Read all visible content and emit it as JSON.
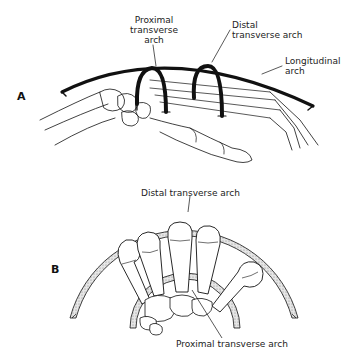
{
  "figure": {
    "panels": [
      {
        "id": "A",
        "letter": "A",
        "labels": {
          "proximal": [
            "Proximal",
            "transverse",
            "arch"
          ],
          "distal": [
            "Distal",
            "transverse arch"
          ],
          "longitudinal": [
            "Longitudinal",
            "arch"
          ]
        }
      },
      {
        "id": "B",
        "letter": "B",
        "labels": {
          "distal": "Distal transverse arch",
          "proximal": "Proximal transverse arch"
        }
      }
    ],
    "colors": {
      "line": "#111111",
      "fill_stipple": "#cfcfcf",
      "background": "#ffffff"
    }
  }
}
